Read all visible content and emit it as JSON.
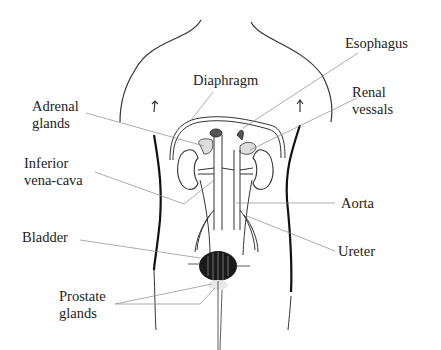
{
  "diagram": {
    "labels": {
      "esophagus": "Esophagus",
      "diaphragm": "Diaphragm",
      "renal_vessels_1": "Renal",
      "renal_vessels_2": "vessals",
      "adrenal_1": "Adrenal",
      "adrenal_2": "glands",
      "inferior_1": "Inferior",
      "inferior_2": "vena-cava",
      "aorta": "Aorta",
      "ureter": "Ureter",
      "bladder": "Bladder",
      "prostate_1": "Prostate",
      "prostate_2": "glands"
    },
    "colors": {
      "ink": "#222222",
      "leader": "#888888",
      "background": "#ffffff"
    }
  }
}
